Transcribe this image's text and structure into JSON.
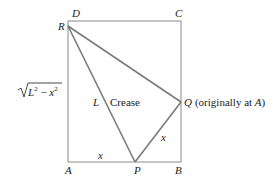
{
  "diagram": {
    "vertices": {
      "A": "A",
      "B": "B",
      "C": "C",
      "D": "D",
      "R": "R",
      "P": "P",
      "Q": "Q"
    },
    "labels": {
      "q_note": "(originally at ",
      "q_note_A": "A",
      "q_note_close": ")",
      "crease": "Crease",
      "L": "L",
      "x_bottom": "x",
      "x_side": "x",
      "left_side_expr_L": "L",
      "left_side_expr_minus": " − ",
      "left_side_expr_x": "x",
      "left_side_expr_exp1": "2",
      "left_side_expr_exp2": "2"
    },
    "colors": {
      "edge": "#8a8a8a",
      "fold": "#7a7a7a",
      "text": "#222222"
    }
  }
}
